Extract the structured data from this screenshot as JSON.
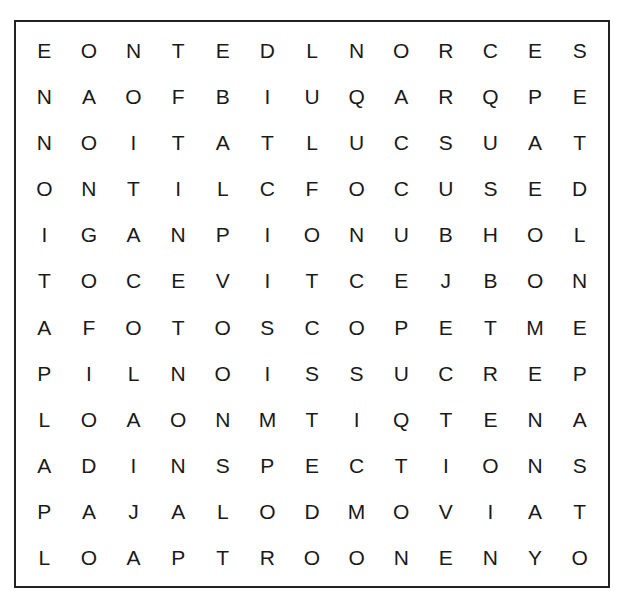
{
  "puzzle": {
    "type": "word-search",
    "columns": 13,
    "rows": 12,
    "grid": [
      [
        "E",
        "O",
        "N",
        "T",
        "E",
        "D",
        "L",
        "N",
        "O",
        "R",
        "C",
        "E",
        "S"
      ],
      [
        "N",
        "A",
        "O",
        "F",
        "B",
        "I",
        "U",
        "Q",
        "A",
        "R",
        "Q",
        "P",
        "E"
      ],
      [
        "N",
        "O",
        "I",
        "T",
        "A",
        "T",
        "L",
        "U",
        "C",
        "S",
        "U",
        "A",
        "T"
      ],
      [
        "O",
        "N",
        "T",
        "I",
        "L",
        "C",
        "F",
        "O",
        "C",
        "U",
        "S",
        "E",
        "D"
      ],
      [
        "I",
        "G",
        "A",
        "N",
        "P",
        "I",
        "O",
        "N",
        "U",
        "B",
        "H",
        "O",
        "L"
      ],
      [
        "T",
        "O",
        "C",
        "E",
        "V",
        "I",
        "T",
        "C",
        "E",
        "J",
        "B",
        "O",
        "N"
      ],
      [
        "A",
        "F",
        "O",
        "T",
        "O",
        "S",
        "C",
        "O",
        "P",
        "E",
        "T",
        "M",
        "E"
      ],
      [
        "P",
        "I",
        "L",
        "N",
        "O",
        "I",
        "S",
        "S",
        "U",
        "C",
        "R",
        "E",
        "P"
      ],
      [
        "L",
        "O",
        "A",
        "O",
        "N",
        "M",
        "T",
        "I",
        "Q",
        "T",
        "E",
        "N",
        "A"
      ],
      [
        "A",
        "D",
        "I",
        "N",
        "S",
        "P",
        "E",
        "C",
        "T",
        "I",
        "O",
        "N",
        "S"
      ],
      [
        "P",
        "A",
        "J",
        "A",
        "L",
        "O",
        "D",
        "M",
        "O",
        "V",
        "I",
        "A",
        "T"
      ],
      [
        "L",
        "O",
        "A",
        "P",
        "T",
        "R",
        "O",
        "O",
        "N",
        "E",
        "N",
        "Y",
        "O"
      ]
    ]
  }
}
